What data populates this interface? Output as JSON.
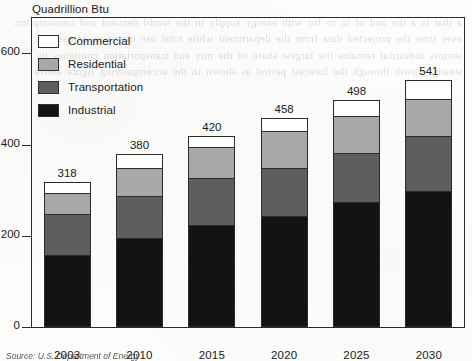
{
  "chart_data": {
    "type": "bar",
    "subtype": "stacked-bar",
    "title": "Quadrillion Btu",
    "xlabel": "",
    "ylabel": "Quadrillion Btu",
    "ylim": [
      0,
      680
    ],
    "yticks": [
      0,
      200,
      400,
      600
    ],
    "ytick_labels": [
      "0",
      "200",
      "400",
      "600"
    ],
    "grid": false,
    "legend_position": "upper-left-inside",
    "categories": [
      "2003",
      "2010",
      "2015",
      "2020",
      "2025",
      "2030"
    ],
    "series": [
      {
        "name": "Industrial",
        "color": "#131313",
        "values": [
          160,
          196,
          226,
          246,
          276,
          300
        ]
      },
      {
        "name": "Transportation",
        "color": "#5e5e5e",
        "values": [
          90,
          93,
          102,
          104,
          108,
          120
        ]
      },
      {
        "name": "Residential",
        "color": "#a8a8a8",
        "values": [
          45,
          61,
          68,
          81,
          81,
          81
        ]
      },
      {
        "name": "Commercial",
        "color": "#ffffff",
        "values": [
          23,
          30,
          24,
          27,
          33,
          40
        ]
      }
    ],
    "totals": [
      318,
      380,
      420,
      458,
      498,
      541
    ],
    "total_labels": [
      "318",
      "380",
      "420",
      "458",
      "498",
      "541"
    ],
    "stack_order_bottom_to_top": [
      "Industrial",
      "Transportation",
      "Residential",
      "Commercial"
    ],
    "legend_entries": [
      "Commercial",
      "Residential",
      "Transportation",
      "Industrial"
    ],
    "source": "Source: U.S. Department of Energy"
  },
  "bleed_text": "a that is a the and of in to for with energy supply in the world demand and consumption over time the projected data from the department while total use increases across all sectors industrial remains the largest share of the mix and transportation continues its steady growth through the forecast period as shown in the accompanying figure above",
  "colors": {
    "axis": "#2b2b2b",
    "text": "#1a1a1a",
    "commercial": "#ffffff",
    "residential": "#a8a8a8",
    "transportation": "#5e5e5e",
    "industrial": "#131313",
    "paper": "#fdfdfb"
  }
}
